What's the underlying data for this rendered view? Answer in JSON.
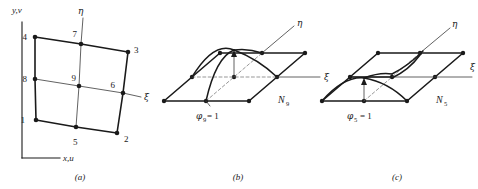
{
  "figure": {
    "colors": {
      "ink": "#1a1a1a",
      "thin": "#3a3a3a",
      "dashed": "#6a6a6a",
      "background": "#ffffff"
    }
  },
  "panel_a": {
    "caption": "(a)",
    "axis_y_label": "y,v",
    "axis_x_label": "x,u",
    "xi_label": "ξ",
    "eta_label": "η",
    "node_labels": [
      "1",
      "2",
      "3",
      "4",
      "5",
      "6",
      "7",
      "8",
      "9"
    ],
    "nodes": [
      {
        "id": "1",
        "x": 36,
        "y": 120,
        "label_x": 27,
        "label_y": 120
      },
      {
        "id": "2",
        "x": 117,
        "y": 133,
        "label_x": 123,
        "label_y": 137
      },
      {
        "id": "3",
        "x": 128,
        "y": 52,
        "label_x": 134,
        "label_y": 50
      },
      {
        "id": "4",
        "x": 35,
        "y": 37,
        "label_x": 25,
        "label_y": 38
      },
      {
        "id": "5",
        "x": 76,
        "y": 127,
        "label_x": 73,
        "label_y": 140
      },
      {
        "id": "6",
        "x": 123,
        "y": 93,
        "label_x": 113,
        "label_y": 87
      },
      {
        "id": "7",
        "x": 81,
        "y": 44,
        "label_x": 76,
        "label_y": 35
      },
      {
        "id": "8",
        "x": 35,
        "y": 79,
        "label_x": 25,
        "label_y": 80
      },
      {
        "id": "9",
        "x": 79,
        "y": 86,
        "label_x": 74,
        "label_y": 78
      }
    ]
  },
  "panel_b": {
    "caption": "(b)",
    "xi_label": "ξ",
    "eta_label": "η",
    "shape_function_label": "N",
    "shape_function_subscript": "9",
    "value_label": "φ",
    "value_subscript": "9",
    "value_equation": "= 1",
    "node_count": 9
  },
  "panel_c": {
    "caption": "(c)",
    "xi_label": "ξ",
    "eta_label": "η",
    "shape_function_label": "N",
    "shape_function_subscript": "5",
    "value_label": "φ",
    "value_subscript": "5",
    "value_equation": "= 1",
    "node_count": 9
  }
}
